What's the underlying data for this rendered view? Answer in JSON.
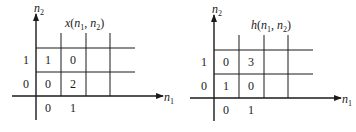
{
  "diagrams": [
    {
      "title": "x(n1, n2)",
      "title_parts": {
        "fn": "x",
        "arg1": "n",
        "sub1": "1",
        "arg2": "n",
        "sub2": "2"
      },
      "y_axis_label": {
        "base": "n",
        "sub": "2"
      },
      "x_axis_label": {
        "base": "n",
        "sub": "1"
      },
      "x_ticks": [
        "0",
        "1"
      ],
      "y_ticks": [
        "0",
        "1"
      ],
      "values": {
        "r1c0": "1",
        "r1c1": "0",
        "r0c0": "0",
        "r0c1": "2"
      }
    },
    {
      "title": "h(n1, n2)",
      "title_parts": {
        "fn": "h",
        "arg1": "n",
        "sub1": "1",
        "arg2": "n",
        "sub2": "2"
      },
      "y_axis_label": {
        "base": "n",
        "sub": "2"
      },
      "x_axis_label": {
        "base": "n",
        "sub": "1"
      },
      "x_ticks": [
        "0",
        "1"
      ],
      "y_ticks": [
        "0",
        "1"
      ],
      "values": {
        "r1c0": "0",
        "r1c1": "3",
        "r0c0": "1",
        "r0c1": "0"
      }
    }
  ]
}
